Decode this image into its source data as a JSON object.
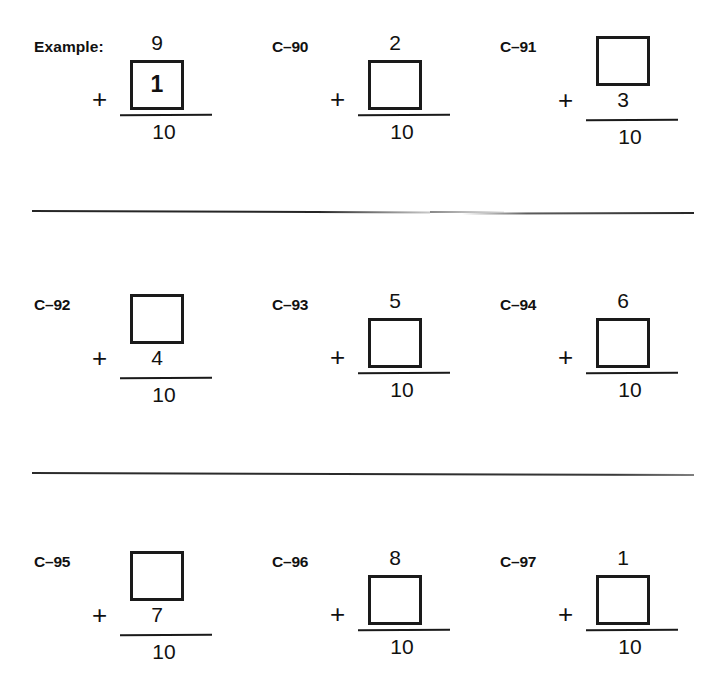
{
  "worksheet": {
    "background_color": "#ffffff",
    "ink_color": "#1a1a1a",
    "sum": "10",
    "operator": "+"
  },
  "problems": [
    {
      "id": "example",
      "label": "Example:",
      "layout": "box-bottom",
      "top_term": "9",
      "bottom_term": "",
      "box_value": "1",
      "box_filled": true,
      "operator": "+",
      "sum": "10"
    },
    {
      "id": "c-90",
      "label": "C–90",
      "layout": "box-bottom",
      "top_term": "2",
      "bottom_term": "",
      "box_value": "",
      "box_filled": false,
      "operator": "+",
      "sum": "10"
    },
    {
      "id": "c-91",
      "label": "C–91",
      "layout": "box-top",
      "top_term": "",
      "bottom_term": "3",
      "box_value": "",
      "box_filled": false,
      "operator": "+",
      "sum": "10"
    },
    {
      "id": "c-92",
      "label": "C–92",
      "layout": "box-top",
      "top_term": "",
      "bottom_term": "4",
      "box_value": "",
      "box_filled": false,
      "operator": "+",
      "sum": "10"
    },
    {
      "id": "c-93",
      "label": "C–93",
      "layout": "box-bottom",
      "top_term": "5",
      "bottom_term": "",
      "box_value": "",
      "box_filled": false,
      "operator": "+",
      "sum": "10"
    },
    {
      "id": "c-94",
      "label": "C–94",
      "layout": "box-bottom",
      "top_term": "6",
      "bottom_term": "",
      "box_value": "",
      "box_filled": false,
      "operator": "+",
      "sum": "10"
    },
    {
      "id": "c-95",
      "label": "C–95",
      "layout": "box-top",
      "top_term": "",
      "bottom_term": "7",
      "box_value": "",
      "box_filled": false,
      "operator": "+",
      "sum": "10"
    },
    {
      "id": "c-96",
      "label": "C–96",
      "layout": "box-bottom",
      "top_term": "8",
      "bottom_term": "",
      "box_value": "",
      "box_filled": false,
      "operator": "+",
      "sum": "10"
    },
    {
      "id": "c-97",
      "label": "C–97",
      "layout": "box-bottom",
      "top_term": "1",
      "bottom_term": "",
      "box_value": "",
      "box_filled": false,
      "operator": "+",
      "sum": "10"
    }
  ]
}
